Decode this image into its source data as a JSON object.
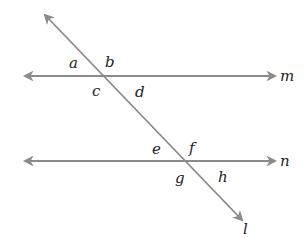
{
  "diagram": {
    "line_color": "#8a8a8a",
    "label_color": "#222222",
    "lines": {
      "m": {
        "label": "m",
        "x1": 25,
        "y1": 76,
        "x2": 275,
        "y2": 76
      },
      "n": {
        "label": "n",
        "x1": 25,
        "y1": 161,
        "x2": 275,
        "y2": 161
      },
      "l": {
        "label": "l",
        "x1": 45,
        "y1": 15,
        "x2": 242,
        "y2": 220
      }
    },
    "angles": {
      "a": "a",
      "b": "b",
      "c": "c",
      "d": "d",
      "e": "e",
      "f": "f",
      "g": "g",
      "h": "h"
    }
  }
}
